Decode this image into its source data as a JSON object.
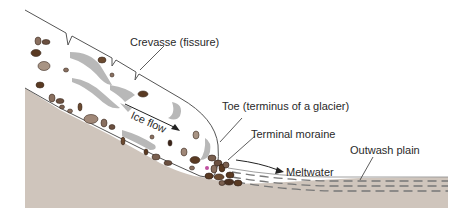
{
  "diagram": {
    "colors": {
      "ground": "#cfc5bc",
      "ice": "#ffffff",
      "outline": "#555555",
      "streak": "#b5b5b5",
      "rock_dark": "#5a3a22",
      "rock_mid": "#8a7060",
      "rock_light": "#a89484",
      "label": "#2a2a2a"
    },
    "labels": {
      "crevasse": "Crevasse (fissure)",
      "ice_flow": "Ice flow",
      "toe": "Toe (terminus of a glacier)",
      "terminal_moraine": "Terminal moraine",
      "meltwater": "Meltwater",
      "outwash_plain": "Outwash plain"
    }
  }
}
